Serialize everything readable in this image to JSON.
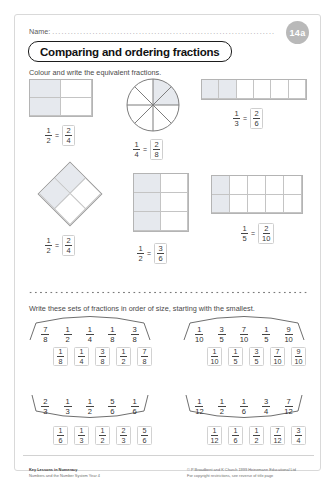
{
  "header": {
    "name_label": "Name:",
    "name_dots": "...........................................................................................",
    "badge": "14a",
    "title": "Comparing and ordering fractions"
  },
  "section1": {
    "instruction": "Colour and write the equivalent fractions.",
    "items": [
      {
        "id": "half-2x2",
        "shape": "grid",
        "cols": 2,
        "rows": 2,
        "shaded": [
          0,
          2
        ],
        "left_num": "1",
        "left_den": "2",
        "right_num": "2",
        "right_den": "4",
        "eq": "="
      },
      {
        "id": "quarter-circle",
        "shape": "circle",
        "slices": 8,
        "shaded": 2,
        "left_num": "1",
        "left_den": "4",
        "right_num": "2",
        "right_den": "8",
        "eq": "="
      },
      {
        "id": "third-1x6",
        "shape": "grid",
        "cols": 6,
        "rows": 1,
        "shaded": [
          0,
          1
        ],
        "left_num": "1",
        "left_den": "3",
        "right_num": "2",
        "right_den": "6",
        "eq": "="
      },
      {
        "id": "half-diamond",
        "shape": "diamond",
        "cols": 2,
        "rows": 2,
        "shaded": [
          0,
          2
        ],
        "left_num": "1",
        "left_den": "2",
        "right_num": "2",
        "right_den": "4",
        "eq": "="
      },
      {
        "id": "half-2x3",
        "shape": "grid",
        "cols": 2,
        "rows": 3,
        "shaded": [
          0,
          2,
          4
        ],
        "left_num": "1",
        "left_den": "2",
        "right_num": "3",
        "right_den": "6",
        "eq": "="
      },
      {
        "id": "fifth-5x2",
        "shape": "grid",
        "cols": 5,
        "rows": 2,
        "shaded": [
          0,
          5
        ],
        "left_num": "1",
        "left_den": "5",
        "right_num": "2",
        "right_den": "10",
        "eq": "="
      }
    ]
  },
  "section2": {
    "instruction": "Write these sets of fractions in order of size, starting with the smallest.",
    "sets": [
      {
        "id": "set-1",
        "given": [
          {
            "n": "7",
            "d": "8"
          },
          {
            "n": "1",
            "d": "2"
          },
          {
            "n": "1",
            "d": "4"
          },
          {
            "n": "1",
            "d": "8"
          },
          {
            "n": "3",
            "d": "8"
          }
        ],
        "answer": [
          {
            "n": "1",
            "d": "8"
          },
          {
            "n": "1",
            "d": "4"
          },
          {
            "n": "3",
            "d": "8"
          },
          {
            "n": "1",
            "d": "2"
          },
          {
            "n": "7",
            "d": "8"
          }
        ]
      },
      {
        "id": "set-2",
        "given": [
          {
            "n": "1",
            "d": "10"
          },
          {
            "n": "3",
            "d": "5"
          },
          {
            "n": "7",
            "d": "10"
          },
          {
            "n": "1",
            "d": "5"
          },
          {
            "n": "9",
            "d": "10"
          }
        ],
        "answer": [
          {
            "n": "1",
            "d": "10"
          },
          {
            "n": "1",
            "d": "5"
          },
          {
            "n": "3",
            "d": "5"
          },
          {
            "n": "7",
            "d": "10"
          },
          {
            "n": "9",
            "d": "10"
          }
        ]
      },
      {
        "id": "set-3",
        "given": [
          {
            "n": "2",
            "d": "3"
          },
          {
            "n": "1",
            "d": "3"
          },
          {
            "n": "1",
            "d": "2"
          },
          {
            "n": "5",
            "d": "6"
          },
          {
            "n": "1",
            "d": "6"
          }
        ],
        "answer": [
          {
            "n": "1",
            "d": "6"
          },
          {
            "n": "1",
            "d": "3"
          },
          {
            "n": "1",
            "d": "2"
          },
          {
            "n": "2",
            "d": "3"
          },
          {
            "n": "5",
            "d": "6"
          }
        ]
      },
      {
        "id": "set-4",
        "given": [
          {
            "n": "1",
            "d": "12"
          },
          {
            "n": "1",
            "d": "2"
          },
          {
            "n": "1",
            "d": "6"
          },
          {
            "n": "3",
            "d": "4"
          },
          {
            "n": "7",
            "d": "12"
          }
        ],
        "answer": [
          {
            "n": "1",
            "d": "12"
          },
          {
            "n": "1",
            "d": "6"
          },
          {
            "n": "1",
            "d": "2"
          },
          {
            "n": "7",
            "d": "12"
          },
          {
            "n": "3",
            "d": "4"
          }
        ]
      }
    ]
  },
  "footer": {
    "series": "Key Lessons in Numeracy",
    "subtitle": "Numbers and the Number System Year 4",
    "copyright": "© P Broadbent and K Church 1999  Heinemann Educational Ltd",
    "restrictions": "For copyright restrictions, see reverse of title page"
  },
  "colors": {
    "shade": "#e6e9ee",
    "ink": "#1d1d1d",
    "badge": "#b9b9b9"
  }
}
